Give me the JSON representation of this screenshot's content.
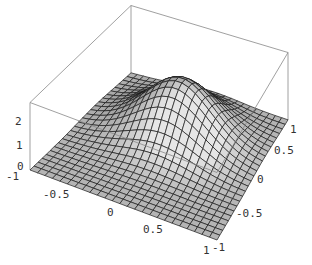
{
  "chart_data": {
    "type": "surface3d",
    "title": "",
    "function_description": "Gaussian-like bump peaked near x=0, y=0.5 over flat floor",
    "x_range": [
      -1,
      1
    ],
    "y_range": [
      -1,
      1
    ],
    "z_range": [
      0,
      2.5
    ],
    "grid_lines": 25,
    "surface_color": "#b4b4b4",
    "mesh_color": "#1a1a1a",
    "box_color": "#888888",
    "z_ticks": [
      "0",
      "1",
      "2"
    ],
    "x_ticks": [
      "-1",
      "-0.5",
      "0",
      "0.5",
      "1"
    ],
    "y_ticks": [
      "-1",
      "-0.5",
      "0",
      "0.5",
      "1"
    ],
    "peak": {
      "x": 0.0,
      "y": 0.3,
      "z": 2.0
    }
  },
  "labels": {
    "z0": "0",
    "z1": "1",
    "z2": "2",
    "xm1": "-1",
    "xm05": "-0.5",
    "x0": "0",
    "x05": "0.5",
    "x1": "1",
    "ym1": "-1",
    "ym05": "-0.5",
    "y0": "0",
    "y05": "0.5",
    "y1": "1"
  }
}
